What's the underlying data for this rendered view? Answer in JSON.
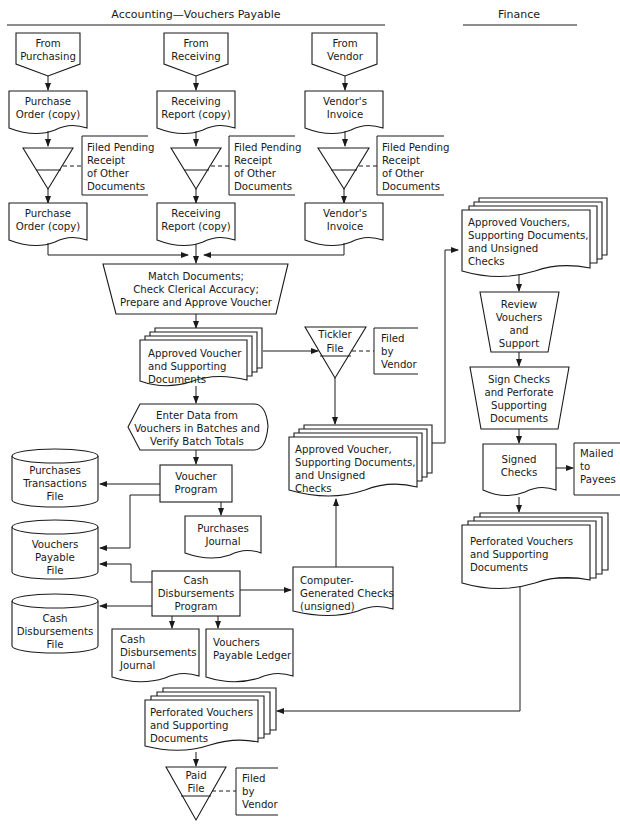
{
  "headers": {
    "left": "Accounting—Vouchers Payable",
    "right": "Finance"
  },
  "sources": [
    {
      "lines": [
        "From",
        "Purchasing"
      ]
    },
    {
      "lines": [
        "From",
        "Receiving"
      ]
    },
    {
      "lines": [
        "From",
        "Vendor"
      ]
    }
  ],
  "docs_top": [
    {
      "lines": [
        "Purchase",
        "Order (copy)"
      ]
    },
    {
      "lines": [
        "Receiving",
        "Report (copy)"
      ]
    },
    {
      "lines": [
        "Vendor's",
        "Invoice"
      ]
    }
  ],
  "pending_file_note": {
    "lines": [
      "Filed Pending",
      "Receipt",
      "of Other",
      "Documents"
    ]
  },
  "docs_bottom": [
    {
      "lines": [
        "Purchase",
        "Order (copy)"
      ]
    },
    {
      "lines": [
        "Receiving",
        "Report (copy)"
      ]
    },
    {
      "lines": [
        "Vendor's",
        "Invoice"
      ]
    }
  ],
  "match_process": {
    "lines": [
      "Match Documents;",
      "Check Clerical Accuracy;",
      "Prepare and Approve Voucher"
    ]
  },
  "approved_voucher_docs": {
    "lines": [
      "Approved Voucher",
      "and Supporting",
      "Documents"
    ]
  },
  "tickler_file": {
    "lines": [
      "Tickler",
      "File"
    ]
  },
  "filed_by_vendor": {
    "lines": [
      "Filed",
      "by",
      "Vendor"
    ]
  },
  "enter_data": {
    "lines": [
      "Enter Data from",
      "Vouchers in Batches and",
      "Verify Batch Totals"
    ]
  },
  "voucher_program": {
    "lines": [
      "Voucher",
      "Program"
    ]
  },
  "purchases_journal": {
    "lines": [
      "Purchases",
      "Journal"
    ]
  },
  "purchases_transactions_file": {
    "lines": [
      "Purchases",
      "Transactions",
      "File"
    ]
  },
  "vouchers_payable_file": {
    "lines": [
      "Vouchers",
      "Payable",
      "File"
    ]
  },
  "cash_disbursements_file": {
    "lines": [
      "Cash",
      "Disbursements",
      "File"
    ]
  },
  "cash_disbursements_program": {
    "lines": [
      "Cash",
      "Disbursements",
      "Program"
    ]
  },
  "cash_disbursements_journal": {
    "lines": [
      "Cash",
      "Disbursements",
      "Journal"
    ]
  },
  "vouchers_payable_ledger": {
    "lines": [
      "Vouchers",
      "Payable Ledger"
    ]
  },
  "computer_checks": {
    "lines": [
      "Computer-",
      "Generated Checks",
      "(unsigned)"
    ]
  },
  "approved_unsigned_docs": {
    "lines": [
      "Approved Voucher,",
      "Supporting Documents,",
      "and Unsigned",
      "Checks"
    ]
  },
  "finance_approved_docs": {
    "lines": [
      "Approved Vouchers,",
      "Supporting Documents,",
      "and Unsigned",
      "Checks"
    ]
  },
  "review_vouchers": {
    "lines": [
      "Review",
      "Vouchers",
      "and",
      "Support"
    ]
  },
  "sign_checks": {
    "lines": [
      "Sign Checks",
      "and Perforate",
      "Supporting",
      "Documents"
    ]
  },
  "signed_checks": {
    "lines": [
      "Signed",
      "Checks"
    ]
  },
  "mailed_to_payees": {
    "lines": [
      "Mailed",
      "to",
      "Payees"
    ]
  },
  "finance_perforated": {
    "lines": [
      "Perforated Vouchers",
      "and Supporting",
      "Documents"
    ]
  },
  "perforated_docs": {
    "lines": [
      "Perforated Vouchers",
      "and Supporting",
      "Documents"
    ]
  },
  "paid_file": {
    "lines": [
      "Paid",
      "File"
    ]
  },
  "paid_filed_by_vendor": {
    "lines": [
      "Filed",
      "by",
      "Vendor"
    ]
  }
}
